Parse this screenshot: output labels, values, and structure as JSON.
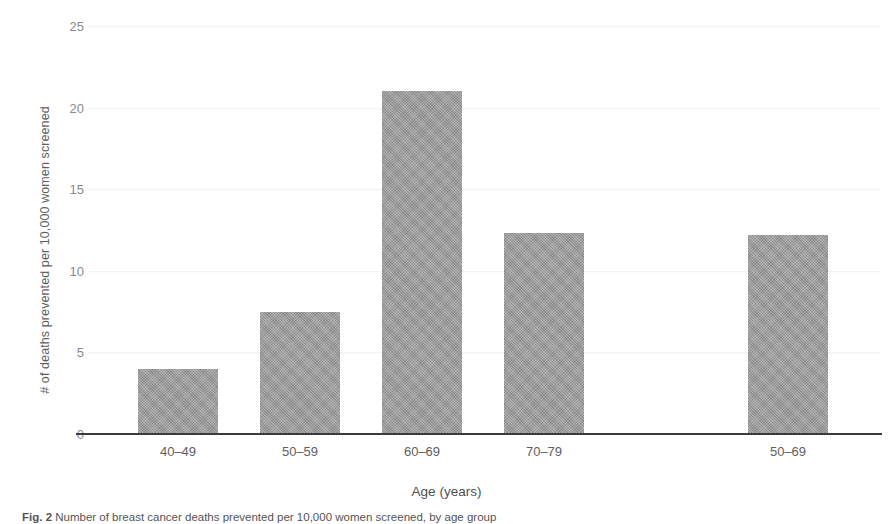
{
  "chart_data": {
    "type": "bar",
    "title": "",
    "subtitle": "",
    "categories": [
      "40–49",
      "50–59",
      "60–69",
      "70–79",
      "50–69"
    ],
    "values": [
      4.0,
      7.5,
      21.0,
      12.3,
      12.2
    ],
    "xlabel": "Age (years)",
    "ylabel": "# of deaths prevented per 10,000 women screened",
    "ylim": [
      0,
      25
    ],
    "yticks": [
      0,
      5,
      10,
      15,
      20,
      25
    ],
    "ytick_labels": [
      "0",
      "5",
      "10",
      "15",
      "20",
      "25"
    ],
    "grid": true,
    "grid_axis": "y",
    "legend": null,
    "legend_position": "none",
    "bar_color": "#9a9a9a",
    "axis_color": "#3b3b3b",
    "tick_label_color": "#8a8a8a",
    "background": "#ffffff",
    "group_gap_after_index": 3,
    "annotations": []
  },
  "figure": {
    "caption_prefix": "Fig. 2",
    "caption_text": "Number of breast cancer deaths prevented per 10,000 women screened, by age group"
  }
}
